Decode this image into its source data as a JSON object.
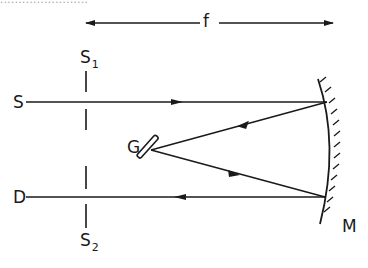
{
  "diagram": {
    "type": "optical-spectrometer-schematic",
    "colors": {
      "ink": "#1a1a1a",
      "background": "#ffffff"
    },
    "labels": {
      "focal_length": "f",
      "source": "S",
      "detector": "D",
      "slit1_main": "S",
      "slit1_sub": "1",
      "slit2_main": "S",
      "slit2_sub": "2",
      "grating": "G",
      "mirror": "M"
    },
    "top_cutoff_text": "........................",
    "elements": [
      {
        "id": "f-dimension",
        "kind": "double-arrow",
        "label": "f"
      },
      {
        "id": "slit-S1",
        "kind": "slit",
        "label": "S1"
      },
      {
        "id": "slit-S2",
        "kind": "slit",
        "label": "S2"
      },
      {
        "id": "grating-G",
        "kind": "grating",
        "label": "G"
      },
      {
        "id": "mirror-M",
        "kind": "concave-mirror",
        "label": "M"
      }
    ],
    "rays": [
      {
        "from": "S",
        "to": "M-top",
        "direction": "right"
      },
      {
        "from": "M-top",
        "to": "G",
        "direction": "left-down"
      },
      {
        "from": "G",
        "to": "M-bottom",
        "direction": "right-down"
      },
      {
        "from": "M-bottom",
        "to": "D",
        "direction": "left"
      }
    ]
  }
}
